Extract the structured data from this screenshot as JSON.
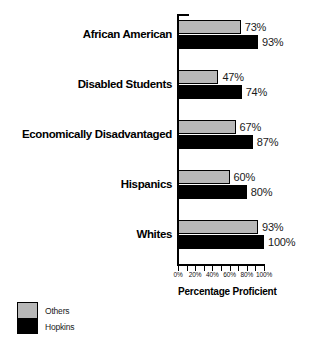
{
  "chart_data": {
    "type": "bar",
    "orientation": "horizontal",
    "title": "",
    "xlabel": "Percentage Proficient",
    "ylabel": "",
    "xlim": [
      0,
      100
    ],
    "grid": false,
    "legend_position": "bottom-left",
    "categories": [
      "African American",
      "Disabled Students",
      "Economically Disadvantaged",
      "Hispanics",
      "Whites"
    ],
    "series": [
      {
        "name": "Others",
        "color": "#b8b8b8",
        "values": [
          73,
          47,
          67,
          60,
          93
        ],
        "value_labels": [
          "73%",
          "47%",
          "67%",
          "60%",
          "93%"
        ]
      },
      {
        "name": "Hopkins",
        "color": "#000000",
        "values": [
          93,
          74,
          87,
          80,
          100
        ],
        "value_labels": [
          "93%",
          "74%",
          "87%",
          "80%",
          "100%"
        ]
      }
    ],
    "x_ticks": [
      0,
      10,
      20,
      30,
      40,
      50,
      60,
      70,
      80,
      90,
      100
    ],
    "x_tick_labels": [
      {
        "value": 0,
        "label": "0%"
      },
      {
        "value": 20,
        "label": "20%"
      },
      {
        "value": 40,
        "label": "40%"
      },
      {
        "value": 60,
        "label": "60%"
      },
      {
        "value": 80,
        "label": "80%"
      },
      {
        "value": 100,
        "label": "100%"
      }
    ]
  },
  "axis": {
    "x_title": "Percentage Proficient"
  },
  "legend": {
    "items": [
      {
        "label": "Others",
        "color": "#b8b8b8"
      },
      {
        "label": "Hopkins",
        "color": "#000000"
      }
    ]
  }
}
